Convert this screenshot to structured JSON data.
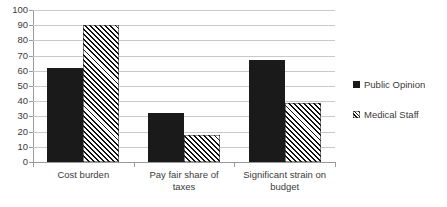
{
  "chart_data": {
    "type": "bar",
    "title": "",
    "subtitle": "",
    "xlabel": "",
    "ylabel": "",
    "ylim": [
      0,
      100
    ],
    "ytick_step": 10,
    "ytick_labels": [
      "0",
      "10",
      "20",
      "30",
      "40",
      "50",
      "60",
      "70",
      "80",
      "90",
      "100"
    ],
    "grid": true,
    "grid_axis": "y",
    "legend_position": "right",
    "categories": [
      "Cost burden",
      "Pay fair share of taxes",
      "Significant strain on budget"
    ],
    "category_lines": [
      [
        "Cost burden"
      ],
      [
        "Pay fair share of",
        "taxes"
      ],
      [
        "Significant strain on",
        "budget"
      ]
    ],
    "series": [
      {
        "name": "Public Opinion",
        "values": [
          62,
          32,
          67
        ],
        "color": "#1a1a1a",
        "fill": "solid"
      },
      {
        "name": "Medical Staff",
        "values": [
          90,
          18,
          39
        ],
        "color": "#ffffff",
        "fill": "diagonal-hatch"
      }
    ]
  },
  "legend": {
    "items": [
      {
        "label": "Public Opinion",
        "swatch": "solid-black-square-icon"
      },
      {
        "label": "Medical Staff",
        "swatch": "hatched-square-icon"
      }
    ]
  },
  "colors": {
    "series_public_opinion": "#1a1a1a",
    "series_medical_staff": "#ffffff",
    "hatch_stroke": "#111111",
    "gridline": "#c9c9c9",
    "axis": "#9a9a9a",
    "text": "#3b3b3b",
    "background": "#ffffff"
  }
}
